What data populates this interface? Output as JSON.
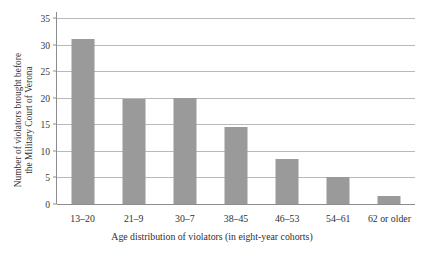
{
  "chart_data": {
    "type": "bar",
    "title": "",
    "xlabel": "Age distribution of violators (in eight-year cohorts)",
    "ylabel_lines": [
      "Number of violators brought before",
      "the Military Court of Verona"
    ],
    "ylabel": "Number of violators brought before the Military Court of Verona",
    "categories": [
      "13–20",
      "21–9",
      "30–7",
      "38–45",
      "46–53",
      "54–61",
      "62 or older"
    ],
    "values": [
      31,
      19.7,
      20,
      14.5,
      8.5,
      5,
      1.5
    ],
    "yticks": [
      0,
      5,
      10,
      15,
      20,
      25,
      30,
      35
    ],
    "ytick_labels": [
      "0",
      "5",
      "10",
      "15",
      "20",
      "25",
      "30",
      "35"
    ],
    "ylim": [
      0,
      35
    ],
    "grid": true,
    "legend": null,
    "bar_color": "#9a9a9a",
    "grid_color": "#b9b9b9",
    "axis_color": "#8d8d8d",
    "background": "#ffffff"
  }
}
